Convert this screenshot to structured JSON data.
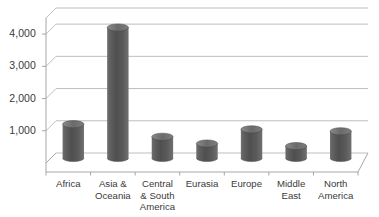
{
  "chart_data": {
    "type": "bar",
    "title": "",
    "xlabel": "",
    "ylabel": "",
    "categories": [
      "Africa",
      "Asia &\nOceania",
      "Central\n& South\nAmerica",
      "Eurasia",
      "Europe",
      "Middle\nEast",
      "North\nAmerica"
    ],
    "values": [
      1050,
      4050,
      660,
      450,
      890,
      370,
      830
    ],
    "ylim": [
      0,
      4500
    ],
    "yticks": [
      1000,
      2000,
      3000,
      4000
    ],
    "ytick_labels": [
      "1,000",
      "2,000",
      "3,000",
      "4,000"
    ],
    "grid": true,
    "legend": false,
    "style": "3d-cylinder-column",
    "series_color": "#585858",
    "gridline_color": "#b7b7b7",
    "axis_color": "#a6a6a6",
    "text_color": "#3a3a3a",
    "background": "#ffffff"
  }
}
